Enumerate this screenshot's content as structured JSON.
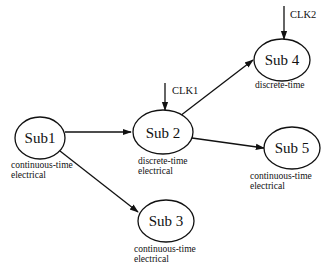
{
  "diagram": {
    "nodes": [
      {
        "id": "sub1",
        "label": "Sub1",
        "type_line1": "continuous-time",
        "type_line2": "electrical"
      },
      {
        "id": "sub2",
        "label": "Sub 2",
        "type_line1": "discrete-time",
        "type_line2": "electrical",
        "clock": "CLK1"
      },
      {
        "id": "sub3",
        "label": "Sub 3",
        "type_line1": "continuous-time",
        "type_line2": "electrical"
      },
      {
        "id": "sub4",
        "label": "Sub 4",
        "type_line1": "discrete-time",
        "clock": "CLK2"
      },
      {
        "id": "sub5",
        "label": "Sub 5",
        "type_line1": "continuous-time",
        "type_line2": "electrical"
      }
    ],
    "edges": [
      {
        "from": "sub1",
        "to": "sub2"
      },
      {
        "from": "sub1",
        "to": "sub3"
      },
      {
        "from": "sub2",
        "to": "sub4"
      },
      {
        "from": "sub2",
        "to": "sub5"
      }
    ],
    "colors": {
      "stroke": "#111111",
      "background": "#ffffff"
    }
  }
}
